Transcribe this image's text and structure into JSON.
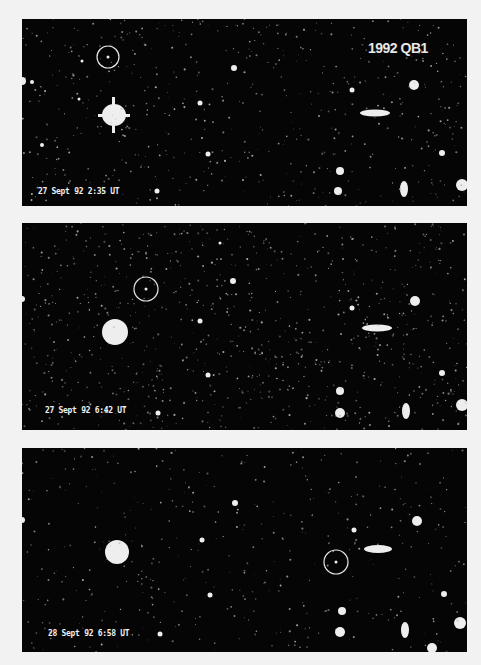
{
  "figure": {
    "title": "1992 QB1",
    "panels": [
      {
        "timestamp": "27 Sept 92 2:35 UT",
        "target_circle": {
          "cx": 86,
          "cy": 38,
          "r": 11
        }
      },
      {
        "timestamp": "27 Sept 92 6:42 UT",
        "target_circle": {
          "cx": 124,
          "cy": 66,
          "r": 12
        }
      },
      {
        "timestamp": "28 Sept 92 6:58 UT",
        "target_circle": {
          "cx": 314,
          "cy": 114,
          "r": 12
        }
      }
    ]
  },
  "colors": {
    "background": "#f2f2f2",
    "sky": "#050505",
    "stars": "#f0f0f0",
    "circle": "#e6e6e6"
  }
}
